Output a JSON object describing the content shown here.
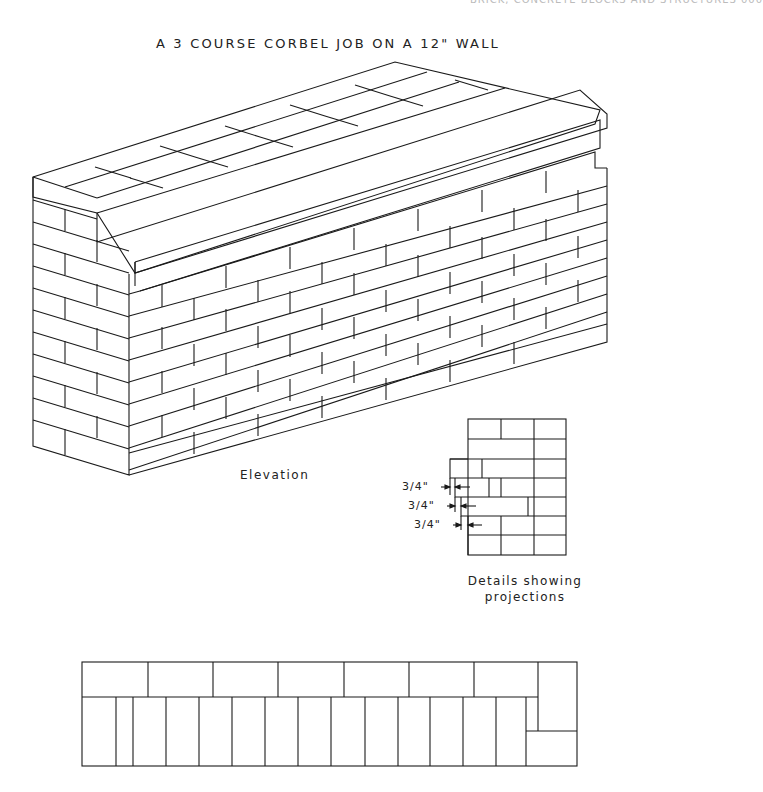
{
  "page_header": "BRICK, CONCRETE BLOCKS AND STRUCTURES     000",
  "title": "A 3 COURSE CORBEL JOB ON A 12\" WALL",
  "elevation": {
    "label": "Elevation",
    "courses": 12,
    "corbel_courses": 3
  },
  "detail": {
    "caption_line1": "Details showing",
    "caption_line2": "projections",
    "dimensions": [
      {
        "label": "3/4\""
      },
      {
        "label": "3/4\""
      },
      {
        "label": "3/4\""
      }
    ]
  },
  "plan": {
    "top_row_bricks": 7,
    "bottom_row_headers": 14
  }
}
